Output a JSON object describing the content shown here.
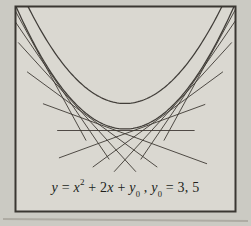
{
  "colors": {
    "paper_outer": "#cbcac3",
    "paper_inner": "#dad8d1",
    "frame_border": "#3a3732",
    "curve_stroke": "#33302b",
    "tangent_stroke": "#3b3731",
    "text_color": "#211f1b"
  },
  "formula": {
    "f1": "y",
    "f2": " = ",
    "f3": "x",
    "f4": "2",
    "f5": " + 2",
    "f6": "x",
    "f7": " + ",
    "f8": "y",
    "f9": "0",
    "f10": " , ",
    "f11": "y",
    "f12": "0",
    "f13": " = 3, 5"
  },
  "figure": {
    "frame_px": {
      "x": 15.5,
      "y": 6.5,
      "width": 220,
      "height": 205
    },
    "mapping": {
      "cx": 125,
      "sx": 35.5,
      "sy": 13,
      "tangent_base_py": 130.5
    },
    "parabolas": [
      {
        "name": "parabola-upper-y0-5",
        "y0": 5,
        "vertex_py": 103.5,
        "u_min": -2.78,
        "u_max": 2.78
      },
      {
        "name": "parabola-lower-y0-3",
        "y0": 3,
        "vertex_py": 129,
        "u_min": -3.12,
        "u_max": 3.12
      }
    ],
    "tangents": [
      {
        "t": 0,
        "u0": -1.9,
        "u1": 1.95
      },
      {
        "t": -0.5,
        "u0": -2.3,
        "u1": 2.3
      },
      {
        "t": 0.5,
        "u0": -1.85,
        "u1": 2.25
      },
      {
        "t": -1,
        "u0": -2.75,
        "u1": 0.9
      },
      {
        "t": 1,
        "u0": -0.9,
        "u1": 2.75
      },
      {
        "t": -1.5,
        "u0": -3.0,
        "u1": 0.3
      },
      {
        "t": 1.5,
        "u0": -0.3,
        "u1": 3.0
      },
      {
        "t": -2,
        "u0": -3.1,
        "u1": -0.45
      },
      {
        "t": 2,
        "u0": 0.45,
        "u1": 3.1
      },
      {
        "t": -2.5,
        "u0": -3.15,
        "u1": -1.1
      },
      {
        "t": 2.5,
        "u0": 1.1,
        "u1": 3.15
      }
    ]
  },
  "chart_data": {
    "type": "line",
    "title": "",
    "equation_label": "y = x² + 2x + y₀ , y₀ = 3, 5",
    "family": "y = x^2 + 2x + y0",
    "y0_values": [
      3,
      5
    ],
    "curves": [
      {
        "name": "y = x^2 + 2x + 3",
        "vertex_xy": [
          -1,
          2
        ]
      },
      {
        "name": "y = x^2 + 2x + 5",
        "vertex_xy": [
          -1,
          4
        ]
      }
    ],
    "tangent_lines_to": "y = x^2 + 2x + 3",
    "tangency_x_values": [
      -3.5,
      -3,
      -2.5,
      -2,
      -1.5,
      -1,
      -0.5,
      0,
      0.5,
      1,
      1.5
    ],
    "x_range_shown": [
      -4.1,
      2.1
    ],
    "axes_shown": false,
    "grid": false,
    "legend": false
  }
}
